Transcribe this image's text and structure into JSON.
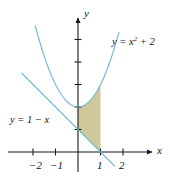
{
  "figure": {
    "kind": "cartesian-plot",
    "background_color": "#ffffff"
  },
  "axes": {
    "x_name": "x",
    "y_name": "y",
    "axis_color": "#1a1a1a",
    "origin_px": {
      "x": 78,
      "y": 152
    },
    "unit_px": {
      "x": 22.5,
      "y": 22.5
    },
    "xlim": [
      -3.1,
      3.8
    ],
    "ylim": [
      -1.4,
      6.1
    ],
    "x_ticks": [
      {
        "value": -2,
        "label": "−2"
      },
      {
        "value": -1,
        "label": "−1"
      },
      {
        "value": 1,
        "label": "1"
      },
      {
        "value": 2,
        "label": "2"
      }
    ],
    "y_ticks": [
      {
        "value": 1,
        "label": ""
      },
      {
        "value": 2,
        "label": ""
      },
      {
        "value": 3,
        "label": ""
      },
      {
        "value": 4,
        "label": ""
      },
      {
        "value": 5,
        "label": ""
      }
    ],
    "grid": false
  },
  "curves": [
    {
      "id": "parabola",
      "label": "y = x",
      "label_exponent": "2",
      "label_tail": " + 2",
      "equation": "y = x^2 + 2",
      "color": "#6cb8d8",
      "stroke_width": 1.1,
      "x_from": -1.9,
      "x_to": 1.82
    },
    {
      "id": "line",
      "label": "y = 1 − x",
      "equation": "y = 1 - x",
      "color": "#6cb8d8",
      "stroke_width": 1.1,
      "x_from": -2.5,
      "x_to": 1.62
    }
  ],
  "shaded_region": {
    "name": "area-between-curves",
    "fill_color": "#cfc89a",
    "x_from": 0,
    "x_to": 1,
    "upper_curve": "parabola",
    "lower_curve": "line"
  },
  "chart_data": {
    "type": "line",
    "title": "",
    "xlabel": "x",
    "ylabel": "y",
    "xlim": [
      -3.1,
      3.8
    ],
    "ylim": [
      -1.4,
      6.1
    ],
    "grid": false,
    "legend": "inline-annotations",
    "x_tick_labels": [
      "−2",
      "−1",
      "1",
      "2"
    ],
    "x_tick_values": [
      -2,
      -1,
      1,
      2
    ],
    "y_tick_values": [
      1,
      2,
      3,
      4,
      5
    ],
    "y_tick_labels": [
      "",
      "",
      "",
      "",
      ""
    ],
    "series": [
      {
        "name": "y = x^2 + 2",
        "kind": "parabola",
        "color": "#6cb8d8",
        "x": [
          -1.9,
          -1.6,
          -1.2,
          -0.8,
          -0.4,
          0,
          0.4,
          0.8,
          1.2,
          1.6,
          1.82
        ],
        "values": [
          5.61,
          4.56,
          3.44,
          2.64,
          2.16,
          2,
          2.16,
          2.64,
          3.44,
          4.56,
          5.31
        ]
      },
      {
        "name": "y = 1 - x",
        "kind": "line",
        "color": "#6cb8d8",
        "x": [
          -2.5,
          -1,
          0,
          1,
          1.62
        ],
        "values": [
          3.5,
          2,
          1,
          0,
          -0.62
        ]
      }
    ],
    "annotations": [
      {
        "text": "y = x² + 2",
        "x": 1.55,
        "y": 4.9
      },
      {
        "text": "y = 1 − x",
        "x": -2.6,
        "y": 1.55
      }
    ],
    "shaded": {
      "between": [
        "y = x^2 + 2",
        "y = 1 - x"
      ],
      "x_range": [
        0,
        1
      ],
      "fill": "#cfc89a"
    }
  }
}
